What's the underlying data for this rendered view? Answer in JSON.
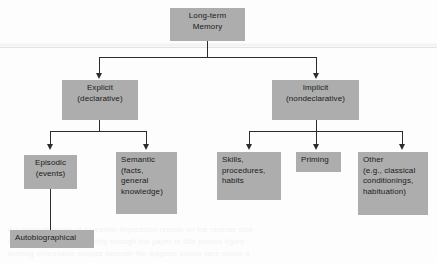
{
  "figure": {
    "type": "hierarchy-tree",
    "colors": {
      "node_fill": "#adadad",
      "node_text": "#1b1b1b",
      "connector": "#2c2c2c",
      "background": "#fdfdfd",
      "divider": "#e3e3e3"
    }
  },
  "nodes": {
    "root": {
      "id": "long-term-memory",
      "lines": [
        "Long-term",
        "Memory"
      ],
      "align": "center"
    },
    "explicit": {
      "id": "explicit",
      "lines": [
        "Explicit",
        "(declarative)"
      ],
      "align": "center"
    },
    "implicit": {
      "id": "implicit",
      "lines": [
        "Implicit",
        "(nondeclarative)"
      ],
      "align": "center"
    },
    "episodic": {
      "id": "episodic",
      "lines": [
        "Episodic",
        "(events)"
      ],
      "align": "center"
    },
    "semantic": {
      "id": "semantic",
      "lines": [
        "Semantic",
        "(facts,",
        "general",
        "knowledge)"
      ],
      "align": "left"
    },
    "autobiographical": {
      "id": "autobiographical",
      "lines": [
        "Autobiographical"
      ],
      "align": "left"
    },
    "skills": {
      "id": "skills",
      "lines": [
        "Skills,",
        "procedures,",
        "habits"
      ],
      "align": "left"
    },
    "priming": {
      "id": "priming",
      "lines": [
        "Priming"
      ],
      "align": "left"
    },
    "other": {
      "id": "other",
      "lines": [
        "Other",
        "(e.g., classical",
        "conditionings,",
        "habituation)"
      ],
      "align": "left"
    }
  },
  "edges": [
    {
      "from": "long-term-memory",
      "to": "explicit",
      "arrow": true
    },
    {
      "from": "long-term-memory",
      "to": "implicit",
      "arrow": true
    },
    {
      "from": "explicit",
      "to": "episodic",
      "arrow": true
    },
    {
      "from": "explicit",
      "to": "semantic",
      "arrow": true
    },
    {
      "from": "episodic",
      "to": "autobiographical",
      "arrow": false
    },
    {
      "from": "implicit",
      "to": "skills",
      "arrow": true
    },
    {
      "from": "implicit",
      "to": "priming",
      "arrow": true
    },
    {
      "from": "implicit",
      "to": "other",
      "arrow": true
    }
  ],
  "background_ghost_text": [
    "the residual traces of an earlier impression remain on the reverse side",
    "of the page and bleed faintly through the paper of this printed figure",
    "forming unreadable shapes beneath the diagram shown here above it"
  ]
}
